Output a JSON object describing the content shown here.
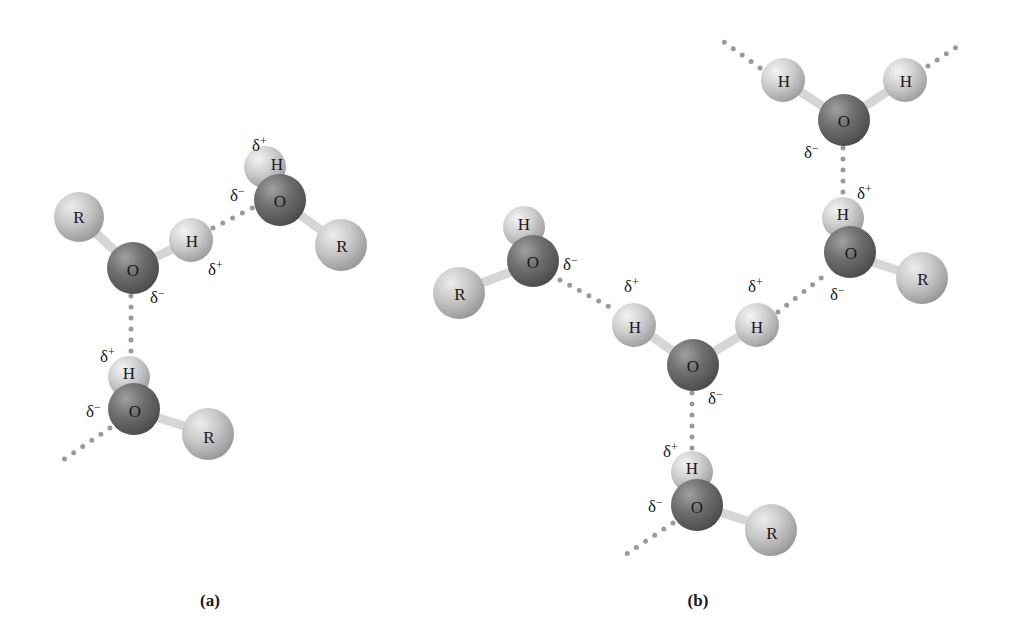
{
  "colors": {
    "oxygen": "#6e6e6e",
    "hydrogen": "#cfcfcf",
    "r_group": "#c4c4c4",
    "bond": "#d8d8d8",
    "hbond_dots": "#9a9a9a",
    "text": "#1a1a1a"
  },
  "labels": {
    "O": "O",
    "H": "H",
    "R": "R",
    "delta_plus": "δ+",
    "delta_minus": "δ−"
  },
  "panels": [
    {
      "caption": "(a)",
      "description": "Three alcohol molecules (R–O–H) linked by hydrogen bonds",
      "molecules": [
        {
          "atoms": [
            "R",
            "O",
            "H"
          ],
          "charges": {
            "O": "δ−",
            "H": "δ+"
          }
        },
        {
          "atoms": [
            "H",
            "O",
            "R"
          ],
          "charges": {
            "O": "δ−",
            "H": "δ+"
          }
        },
        {
          "atoms": [
            "H",
            "O",
            "R"
          ],
          "charges": {
            "O": "δ−",
            "H": "δ+"
          }
        }
      ]
    },
    {
      "caption": "(b)",
      "description": "Water molecule hydrogen-bonded to alcohol molecules and another water molecule",
      "molecules": [
        {
          "atoms": [
            "H",
            "O",
            "R"
          ],
          "charges": {
            "O": "δ−"
          }
        },
        {
          "atoms": [
            "H",
            "O",
            "H"
          ],
          "charges": {
            "H1": "δ+",
            "H2": "δ+",
            "O": "δ−"
          }
        },
        {
          "atoms": [
            "H",
            "O",
            "H"
          ],
          "charges": {
            "O": "δ−"
          }
        },
        {
          "atoms": [
            "H",
            "O",
            "R"
          ],
          "charges": {
            "H": "δ+",
            "O": "δ−"
          }
        },
        {
          "atoms": [
            "H",
            "O",
            "R"
          ],
          "charges": {
            "H": "δ+",
            "O": "δ−"
          }
        }
      ]
    }
  ]
}
